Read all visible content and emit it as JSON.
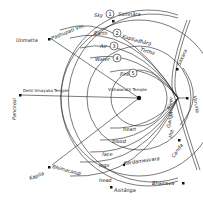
{
  "diagram": {
    "center_label": "Vishwanath Temple",
    "west_label": "Dehli Vinayaka Temple",
    "elements": [
      {
        "num": "1",
        "label": "Sky"
      },
      {
        "num": "2",
        "label": "Earth"
      },
      {
        "num": "3",
        "label": "Air"
      },
      {
        "num": "4",
        "label": "Water"
      },
      {
        "num": "5",
        "label": "Fire"
      }
    ],
    "body_parts": [
      "heart",
      "blood",
      "face",
      "legs",
      "head"
    ],
    "places": {
      "somnara": "Somnāra",
      "kapiladhara": "Kapiladhārā",
      "tirtha": "Tirtha",
      "pashupati": "Pashupati Vin.",
      "unmatta": "Unmatta",
      "panchkosi": "Panckosi",
      "kapila": "Kapila",
      "bhimachandi": "Bhimacandi",
      "kardamesvara": "Kardameśvara",
      "astodaya": "Asitāṅga",
      "bhairava": "Bhairava",
      "sakara": "Sakara",
      "ganga": "Gaṅgā",
      "river": "River",
      "the": "the",
      "varuna": "Varuna",
      "canda": "Canda"
    },
    "colors": {
      "line": "#222222",
      "background": "#ffffff"
    }
  }
}
